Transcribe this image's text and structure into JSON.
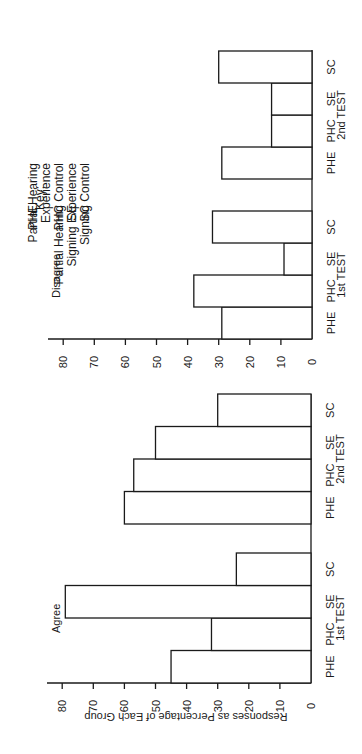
{
  "chart_data": [
    {
      "type": "bar",
      "title": "Agree",
      "orientation": "rotated 90° (bars extend leftward on page; read with page turned)",
      "ylabel": "Responses as Percentage of Each Group",
      "ylim": [
        0,
        85
      ],
      "yticks": [
        0,
        10,
        20,
        30,
        40,
        50,
        60,
        70,
        80
      ],
      "groups": [
        "1st TEST",
        "2nd TEST"
      ],
      "categories": [
        "PHE",
        "PHC",
        "SE",
        "SC"
      ],
      "series": [
        {
          "name": "1st TEST",
          "values": [
            45,
            32,
            79,
            24
          ]
        },
        {
          "name": "2nd TEST",
          "values": [
            60,
            57,
            50,
            30
          ]
        }
      ],
      "grid": false
    },
    {
      "type": "bar",
      "title": "Disagree",
      "orientation": "rotated 90° (bars extend leftward on page; read with page turned)",
      "ylabel": "",
      "ylim": [
        0,
        85
      ],
      "yticks": [
        0,
        10,
        20,
        30,
        40,
        50,
        60,
        70,
        80
      ],
      "groups": [
        "1st TEST",
        "2nd TEST"
      ],
      "categories": [
        "PHE",
        "PHC",
        "SE",
        "SC"
      ],
      "series": [
        {
          "name": "1st TEST",
          "values": [
            29,
            38,
            9,
            32
          ]
        },
        {
          "name": "2nd TEST",
          "values": [
            29,
            13,
            13,
            30
          ]
        }
      ],
      "grid": false
    }
  ],
  "labels": {
    "agree": "Agree",
    "disagree": "Disagree",
    "ylabel": "Responses as Percentage of Each Group",
    "test1": "1st TEST",
    "test2": "2nd TEST",
    "cats": [
      "PHE",
      "PHC",
      "SE",
      "SC"
    ],
    "ticks": [
      "0",
      "10",
      "20",
      "30",
      "40",
      "50",
      "60",
      "70",
      "80"
    ]
  },
  "key": {
    "title": "Key:",
    "entries": [
      {
        "abbr": "PHE",
        "line1": "Partial Hearing",
        "line2": "Experience"
      },
      {
        "abbr": "PHC",
        "line1": "Partial Hearing Control"
      },
      {
        "abbr": "SE",
        "line1": "Signing Experience"
      },
      {
        "abbr": "SC",
        "line1": "Signing Control"
      }
    ]
  }
}
